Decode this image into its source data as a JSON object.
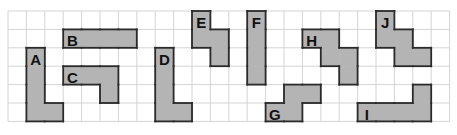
{
  "grid": {
    "x0": 8,
    "y0": 11,
    "cell": 18.4,
    "cols": 24,
    "rows": 6,
    "line_color": "#d4d4d4"
  },
  "shape_style": {
    "fill": "#b4b4b4",
    "stroke": "#2a2a2a"
  },
  "shapes": [
    {
      "label": "A",
      "cells": [
        [
          1,
          2
        ],
        [
          1,
          3
        ],
        [
          1,
          4
        ],
        [
          1,
          5
        ],
        [
          2,
          5
        ]
      ],
      "label_pos": [
        1.5,
        2.7
      ]
    },
    {
      "label": "B",
      "cells": [
        [
          3,
          1
        ],
        [
          4,
          1
        ],
        [
          5,
          1
        ],
        [
          6,
          1
        ]
      ],
      "label_pos": [
        3.5,
        1.7
      ]
    },
    {
      "label": "C",
      "cells": [
        [
          3,
          3
        ],
        [
          4,
          3
        ],
        [
          5,
          3
        ],
        [
          5,
          4
        ]
      ],
      "label_pos": [
        3.5,
        3.7
      ]
    },
    {
      "label": "D",
      "cells": [
        [
          8,
          2
        ],
        [
          8,
          3
        ],
        [
          8,
          4
        ],
        [
          8,
          5
        ],
        [
          9,
          5
        ]
      ],
      "label_pos": [
        8.5,
        2.7
      ]
    },
    {
      "label": "E",
      "cells": [
        [
          10,
          0
        ],
        [
          10,
          1
        ],
        [
          11,
          1
        ],
        [
          11,
          2
        ]
      ],
      "label_pos": [
        10.5,
        0.7
      ]
    },
    {
      "label": "F",
      "cells": [
        [
          13,
          0
        ],
        [
          13,
          1
        ],
        [
          13,
          2
        ],
        [
          13,
          3
        ]
      ],
      "label_pos": [
        13.5,
        0.7
      ]
    },
    {
      "label": "G",
      "cells": [
        [
          14,
          5
        ],
        [
          15,
          5
        ],
        [
          15,
          4
        ],
        [
          16,
          4
        ]
      ],
      "label_pos": [
        14.5,
        5.7
      ]
    },
    {
      "label": "H",
      "cells": [
        [
          16,
          1
        ],
        [
          17,
          1
        ],
        [
          17,
          2
        ],
        [
          18,
          2
        ],
        [
          18,
          3
        ]
      ],
      "label_pos": [
        16.5,
        1.7
      ]
    },
    {
      "label": "I",
      "cells": [
        [
          19,
          5
        ],
        [
          20,
          5
        ],
        [
          21,
          5
        ],
        [
          22,
          5
        ],
        [
          22,
          4
        ]
      ],
      "label_pos": [
        19.5,
        5.7
      ]
    },
    {
      "label": "J",
      "cells": [
        [
          20,
          0
        ],
        [
          20,
          1
        ],
        [
          21,
          1
        ],
        [
          21,
          2
        ],
        [
          22,
          2
        ]
      ],
      "label_pos": [
        20.5,
        0.7
      ]
    }
  ]
}
